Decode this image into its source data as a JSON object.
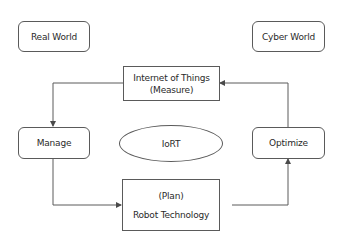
{
  "diagram": {
    "title": "IoRT",
    "colors": {
      "stroke": "#5a5a5a",
      "text": "#2a2a2a",
      "background": "#ffffff"
    },
    "nodes": {
      "real_world": {
        "label": "Real World",
        "shape": "rounded-rect"
      },
      "cyber_world": {
        "label": "Cyber World",
        "shape": "rounded-rect"
      },
      "iot": {
        "line1": "Internet of Things",
        "line2": "(Measure)",
        "shape": "rect"
      },
      "manage": {
        "label": "Manage",
        "shape": "rounded-rect"
      },
      "iort": {
        "label": "IoRT",
        "shape": "ellipse"
      },
      "optimize": {
        "label": "Optimize",
        "shape": "rounded-rect"
      },
      "robot": {
        "line1": "(Plan)",
        "line2": "Robot Technology",
        "shape": "rect"
      }
    },
    "edges": [
      {
        "from": "Internet of Things (Measure)",
        "to": "Manage"
      },
      {
        "from": "Manage",
        "to": "Robot Technology (Plan)"
      },
      {
        "from": "Robot Technology (Plan)",
        "to": "Optimize"
      },
      {
        "from": "Optimize",
        "to": "Internet of Things (Measure)"
      }
    ]
  }
}
